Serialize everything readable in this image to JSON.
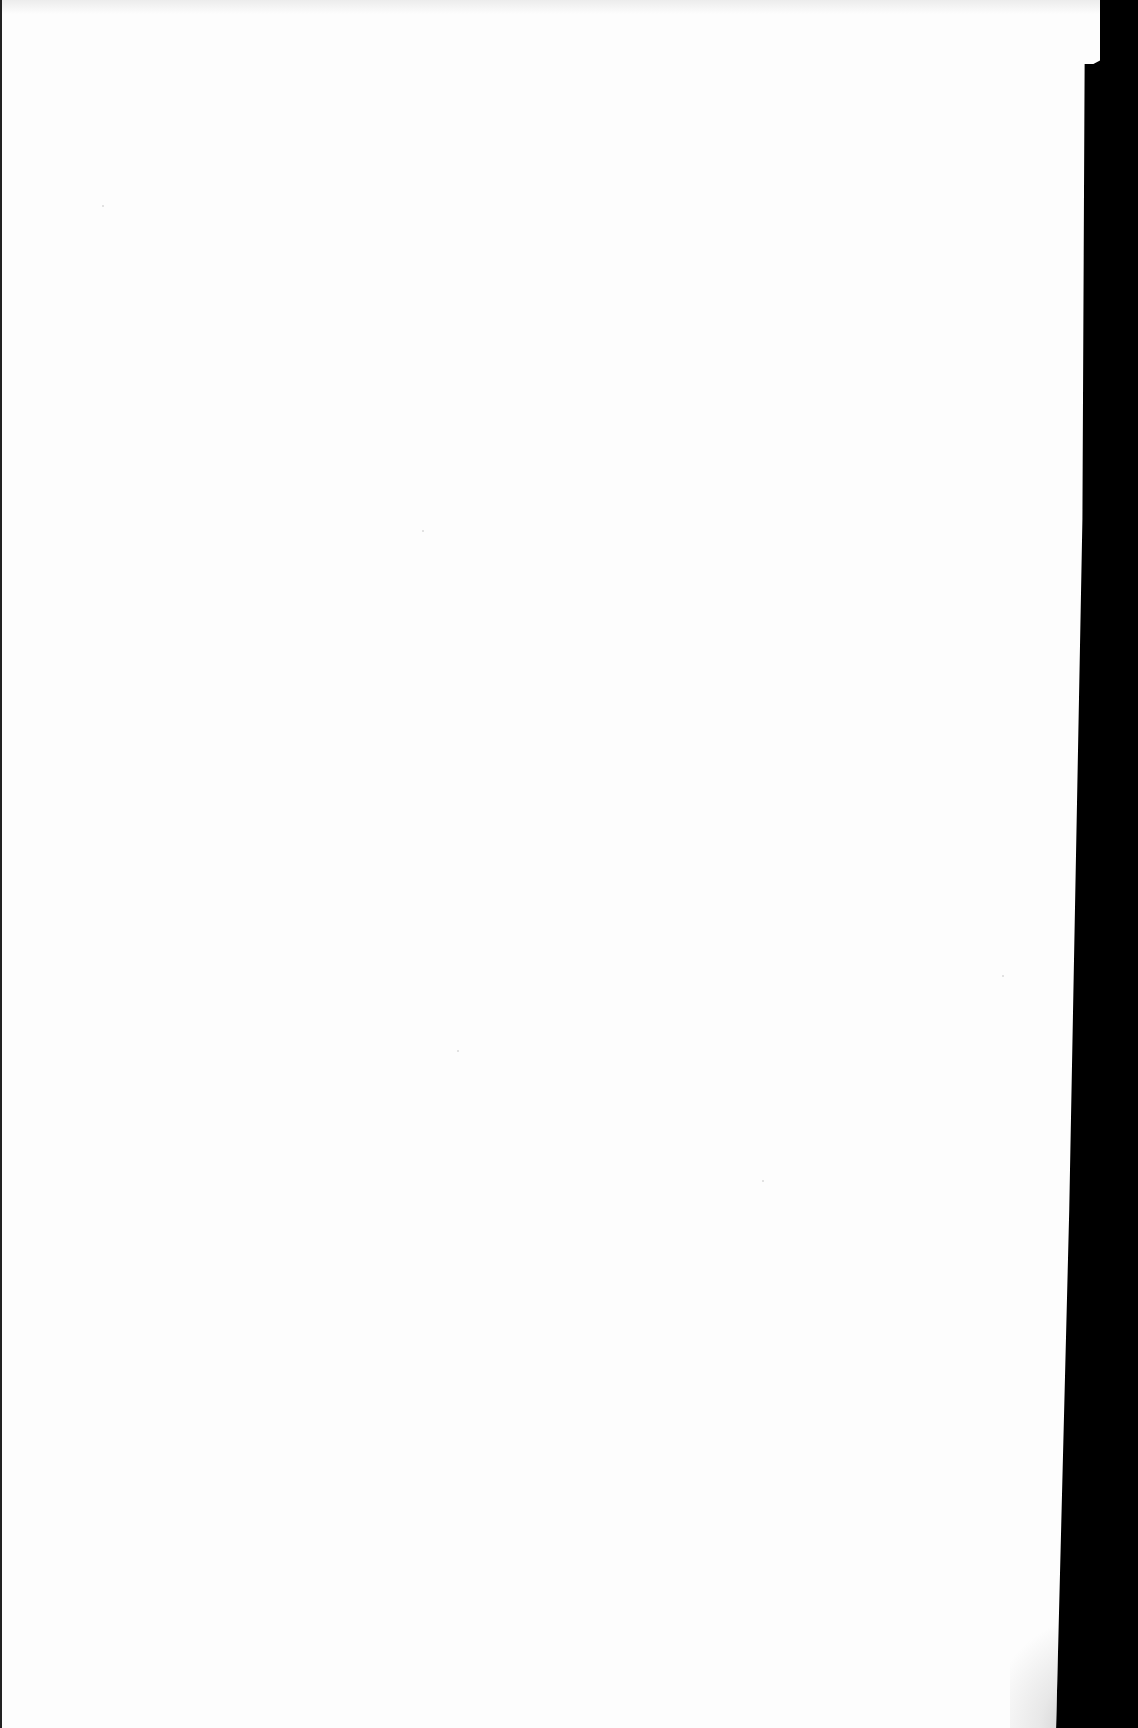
{
  "document": {
    "type": "blank scanned page",
    "text": "",
    "colors": {
      "paper": "#fdfdfd",
      "background": "#000000",
      "shadow": "#bdbdbd"
    }
  }
}
